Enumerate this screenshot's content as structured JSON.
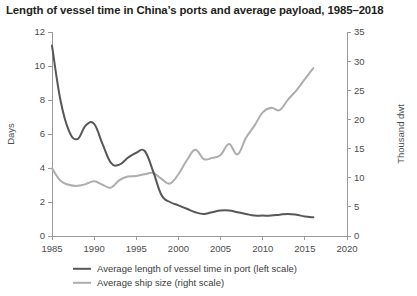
{
  "chart_data": {
    "type": "line",
    "title": "Length of vessel time in China’s ports and average payload, 1985–2018",
    "xlabel": "",
    "ylabel": "Days",
    "y2label": "Thousand dwt",
    "xlim": [
      1985,
      2020
    ],
    "ylim": [
      0,
      12
    ],
    "y2lim": [
      0,
      35
    ],
    "xticks": [
      1985,
      1990,
      1995,
      2000,
      2005,
      2010,
      2015,
      2020
    ],
    "xtick_labels": [
      "1985",
      "1990",
      "1995",
      "2000",
      "2005",
      "2010",
      "2015",
      "2020"
    ],
    "yticks": [
      0,
      2,
      4,
      6,
      8,
      10,
      12
    ],
    "ytick_labels": [
      "0",
      "2",
      "4",
      "6",
      "8",
      "10",
      "12"
    ],
    "y2ticks": [
      0,
      5,
      10,
      15,
      20,
      25,
      30,
      35
    ],
    "y2tick_labels": [
      "0",
      "5",
      "10",
      "15",
      "20",
      "25",
      "30",
      "35"
    ],
    "grid": false,
    "legend_position": "bottom",
    "x": [
      1985,
      1986,
      1987,
      1988,
      1989,
      1990,
      1991,
      1992,
      1993,
      1994,
      1995,
      1996,
      1997,
      1998,
      1999,
      2000,
      2001,
      2002,
      2003,
      2004,
      2005,
      2006,
      2007,
      2008,
      2009,
      2010,
      2011,
      2012,
      2013,
      2014,
      2015,
      2016
    ],
    "series": [
      {
        "name": "Average length of vessel time in port (left scale)",
        "axis": "left",
        "unit": "Days",
        "color": "#575757",
        "values": [
          11.2,
          8.0,
          6.2,
          5.7,
          6.5,
          6.6,
          5.4,
          4.3,
          4.2,
          4.6,
          4.9,
          5.0,
          3.8,
          2.4,
          2.0,
          1.8,
          1.6,
          1.4,
          1.3,
          1.4,
          1.5,
          1.5,
          1.4,
          1.3,
          1.2,
          1.2,
          1.2,
          1.25,
          1.3,
          1.25,
          1.15,
          1.1
        ]
      },
      {
        "name": "Average ship size (right scale)",
        "axis": "right",
        "unit": "Thousand dwt",
        "color": "#adadad",
        "values": [
          11.6,
          9.5,
          8.8,
          8.6,
          8.9,
          9.4,
          8.8,
          8.3,
          9.6,
          10.2,
          10.3,
          10.6,
          10.8,
          9.8,
          9.0,
          10.6,
          13.0,
          14.8,
          13.2,
          13.4,
          13.9,
          15.8,
          14.0,
          16.8,
          18.9,
          21.2,
          22.0,
          21.6,
          23.4,
          25.0,
          26.9,
          28.8
        ]
      }
    ],
    "legend": [
      {
        "label": "Average length of vessel time in port (left scale)",
        "color": "#575757"
      },
      {
        "label": "Average ship size (right scale)",
        "color": "#adadad"
      }
    ]
  }
}
